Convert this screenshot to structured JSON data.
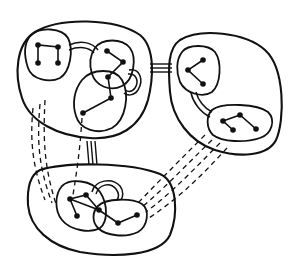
{
  "diagram": {
    "type": "hierarchical-clustered-graph",
    "colors": {
      "stroke": "#111111",
      "background": "#ffffff"
    },
    "clusters": [
      {
        "id": "A",
        "position": "top-left",
        "subclusters": [
          {
            "id": "A1",
            "shape": "square-path",
            "nodes": 4
          },
          {
            "id": "A2",
            "nodes": 2
          },
          {
            "id": "A3",
            "nodes": 3
          }
        ]
      },
      {
        "id": "B",
        "position": "right",
        "subclusters": [
          {
            "id": "B1",
            "nodes": 3
          },
          {
            "id": "B2",
            "nodes": 4
          }
        ]
      },
      {
        "id": "C",
        "position": "bottom",
        "subclusters": [
          {
            "id": "C1",
            "nodes": 4
          },
          {
            "id": "C2",
            "nodes": 2
          }
        ]
      }
    ],
    "connections": [
      {
        "from": "A",
        "to": "B",
        "style": "triple-line"
      },
      {
        "from": "A",
        "to": "C",
        "style": "triple-line"
      },
      {
        "from": "A",
        "to": "C",
        "style": "dashed-bundle"
      },
      {
        "from": "B",
        "to": "C",
        "style": "dashed-bundle"
      }
    ]
  }
}
